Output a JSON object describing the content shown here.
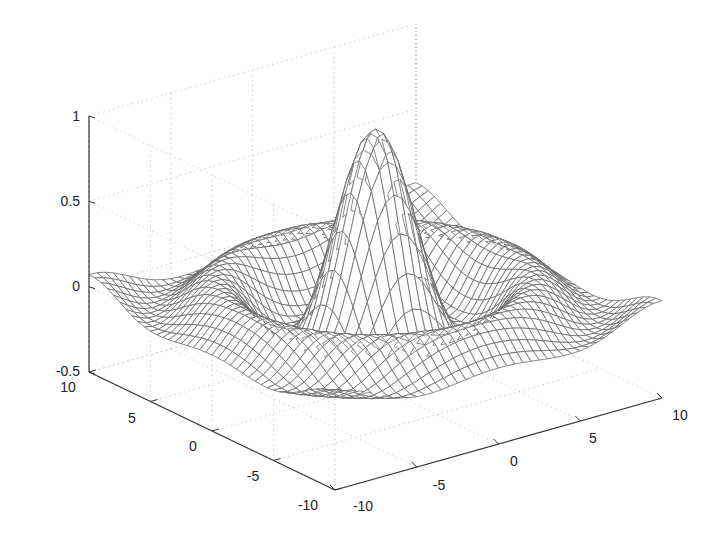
{
  "chart_data": {
    "type": "surface-mesh",
    "title": "",
    "function": "z = sin(r)/r, r = sqrt(x^2 + y^2)",
    "x": {
      "label": "",
      "range": [
        -10,
        10
      ],
      "ticks": [
        "-10",
        "-5",
        "0",
        "5",
        "10"
      ]
    },
    "y": {
      "label": "",
      "range": [
        -10,
        10
      ],
      "ticks": [
        "10",
        "5",
        "0",
        "-5",
        "-10"
      ]
    },
    "z": {
      "label": "",
      "range": [
        -0.5,
        1
      ],
      "ticks": [
        "1",
        "0.5",
        "0",
        "-0.5"
      ]
    },
    "grid": true,
    "mesh_resolution": 41,
    "peak": {
      "x": 0,
      "y": 0,
      "z": 1
    },
    "colors": {
      "mesh": "#6a6a6a",
      "axis": "#333333",
      "grid": "#bdbdbd"
    }
  },
  "labels": {
    "z_ticks": [
      "1",
      "0.5",
      "0",
      "-0.5"
    ],
    "y_ticks": [
      "10",
      "5",
      "0",
      "-5",
      "-10"
    ],
    "x_ticks": [
      "-10",
      "-5",
      "0",
      "5",
      "10"
    ]
  }
}
